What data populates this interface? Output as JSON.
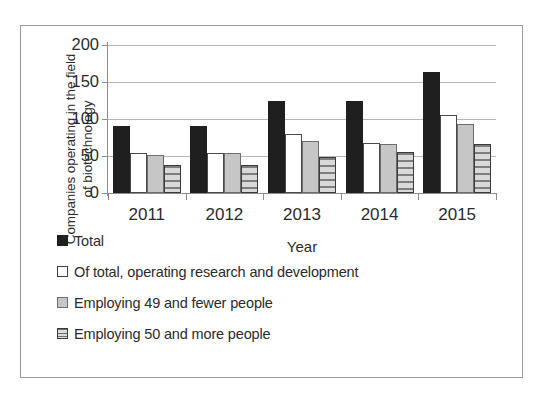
{
  "chart_data": {
    "type": "bar",
    "title": "",
    "xlabel": "Year",
    "ylabel": "Companies operating in the field of biotechnology",
    "ylabel_lines": [
      "Companies operating in the field",
      "of biotechnology"
    ],
    "categories": [
      "2011",
      "2012",
      "2013",
      "2014",
      "2015"
    ],
    "ylim": [
      0,
      200
    ],
    "yticks": [
      0,
      50,
      100,
      150,
      200
    ],
    "ytick_labels": [
      "0",
      "50",
      "100",
      "150",
      "200"
    ],
    "grid": true,
    "legend_position": "bottom-left",
    "series": [
      {
        "name": "Total",
        "swatch": "total",
        "color": "#1f1f1f",
        "values": [
          90,
          90,
          124,
          125,
          163
        ]
      },
      {
        "name": "Of total, operating research and development",
        "swatch": "rd",
        "color": "#ffffff",
        "values": [
          54,
          54,
          80,
          68,
          105
        ]
      },
      {
        "name": "Employing 49 and fewer people",
        "swatch": "small",
        "color": "#c6c6c6",
        "values": [
          51,
          54,
          70,
          66,
          93
        ]
      },
      {
        "name": "Employing 50 and more people",
        "swatch": "large",
        "color": "#b5b5b5",
        "values": [
          38,
          38,
          49,
          55,
          66
        ]
      }
    ]
  },
  "frame": {
    "border_color": "#9a9a9a",
    "background": "#ffffff"
  }
}
